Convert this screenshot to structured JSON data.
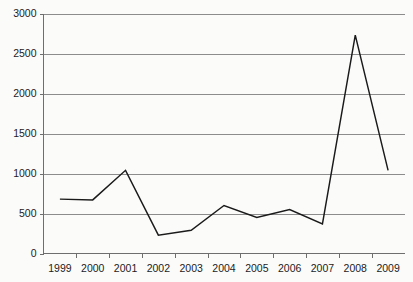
{
  "chart_data": {
    "type": "line",
    "title": "",
    "subtitle": "",
    "xlabel": "",
    "ylabel": "",
    "categories": [
      "1999",
      "2000",
      "2001",
      "2002",
      "2003",
      "2004",
      "2005",
      "2006",
      "2007",
      "2008",
      "2009"
    ],
    "series": [
      {
        "name": "series-1",
        "values": [
          680,
          670,
          1040,
          230,
          290,
          600,
          450,
          550,
          370,
          2730,
          1040
        ],
        "color": "#1a1a1a"
      }
    ],
    "ylim": [
      0,
      3000
    ],
    "y_ticks": [
      0,
      500,
      1000,
      1500,
      2000,
      2500,
      3000
    ],
    "y_tick_labels": [
      "0",
      "500",
      "1000",
      "1500",
      "2000",
      "2500",
      "3000"
    ],
    "x_tick_labels": [
      "1999",
      "2000",
      "2001",
      "2002",
      "2003",
      "2004",
      "2005",
      "2006",
      "2007",
      "2008",
      "2009"
    ],
    "grid": "horizontal",
    "legend": "none",
    "legend_position": "none",
    "background_color": "#fbfbfa",
    "grid_color": "#8c8c8c",
    "axis_color": "#6e6e6e",
    "line_color": "#1a1a1a",
    "annotations": []
  }
}
